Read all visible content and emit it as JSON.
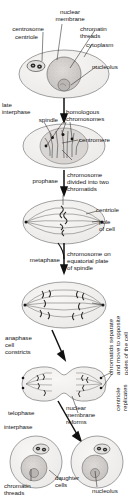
{
  "figure": {
    "ink_color": "#161616",
    "cell_fill": "#f0efee",
    "nucleus_fill": "#cfcdcb",
    "nucleolus_fill": "#bdbab8",
    "stroke": "#6b6b6b"
  },
  "labels": {
    "nuclear_membrane": "nuclear\nmembrane",
    "centrosome": "centrosome",
    "centriole_top": "centriole",
    "chromatin_threads": "chromatin\nthreads",
    "cytoplasm": "cytoplasm",
    "nucleolus_top": "nucleolus",
    "late_interphase": "late\ninterphase",
    "spindle": "spindle",
    "homologous_chromosomes": "homologous\nchromosomes",
    "centromere": "centromere",
    "prophase": "prophase",
    "chromosome_divided": "chromosome\ndivided into two\nchromatids",
    "centriole_mid": "centriole",
    "pole_of_cell": "pole\nof cell",
    "metaphase": "metaphase",
    "chromosome_equatorial": "chromosome on\nequatorial plate\nof spindle",
    "chromatids_separate": "chromatids separate\nand move to opposite\npoles of the cell",
    "anaphase_cell_constricts": "anaphase\ncell\nconstricts",
    "centriole_replicates": "centriole\nreplicates",
    "telophase": "telophase",
    "nuclear_membrane_reforms": "nuclear\nmembrane\nreforms",
    "interphase": "interphase",
    "daughter_cells": "daughter\ncells",
    "chromatin_threads_bottom": "chromatin\nthreads",
    "nucleolus_bottom": "nucleolus"
  },
  "stages": [
    {
      "name": "interphase-cell",
      "order": 1
    },
    {
      "name": "late-interphase-cell",
      "order": 2
    },
    {
      "name": "prophase-cell",
      "order": 3
    },
    {
      "name": "metaphase-cell",
      "order": 4
    },
    {
      "name": "anaphase-cell",
      "order": 5
    },
    {
      "name": "telophase-cell",
      "order": 6
    },
    {
      "name": "daughter-cells",
      "order": 7
    }
  ]
}
